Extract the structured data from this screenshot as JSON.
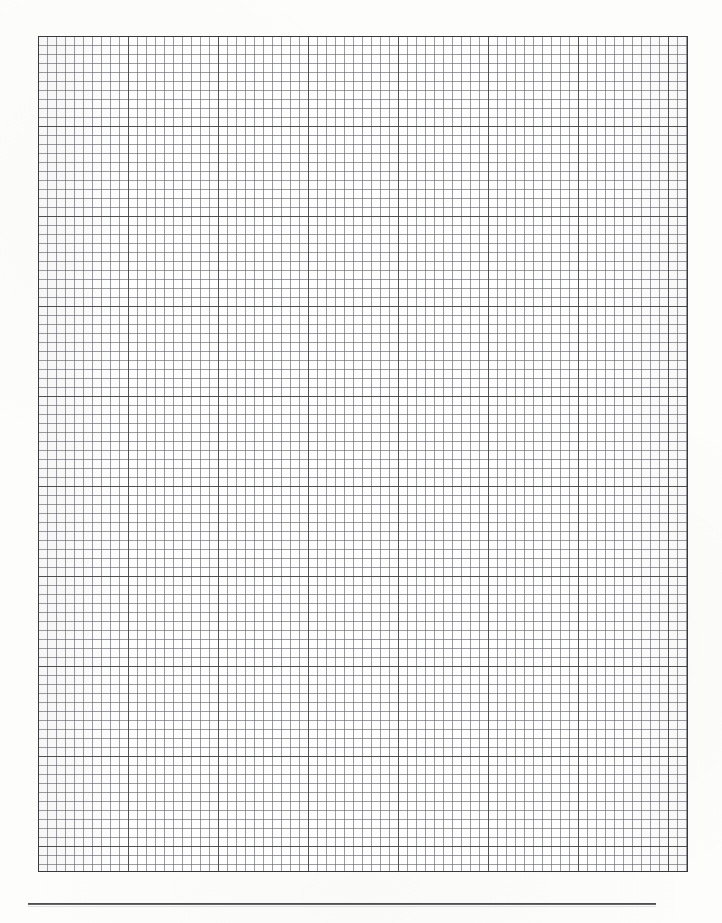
{
  "document": {
    "kind": "graph-paper-scan",
    "page_width": 722,
    "page_height": 923,
    "background_color": "#fdfdfc",
    "caption": ""
  },
  "grid": {
    "name": "graph-paper-grid",
    "x": 38,
    "y": 36,
    "width": 650,
    "height": 836,
    "minor_cell_px": 9,
    "major_cell_px": 90,
    "minor_cells_across": 72,
    "minor_cells_down": 93,
    "major_blocks_across": 7,
    "major_blocks_down": 9,
    "minor_line_color": "#606266",
    "major_line_color": "#3c3c3e",
    "border_color": "#39393b",
    "cell_fill_color": "#fefefe",
    "label": ""
  },
  "footer_rule": {
    "name": "footer-horizontal-rule",
    "x": 28,
    "y": 903,
    "width": 628,
    "thickness": 2,
    "color": "#3a3a3c",
    "label": ""
  },
  "margins": {
    "left": 38,
    "right": 34,
    "top": 36,
    "bottom": 51
  }
}
